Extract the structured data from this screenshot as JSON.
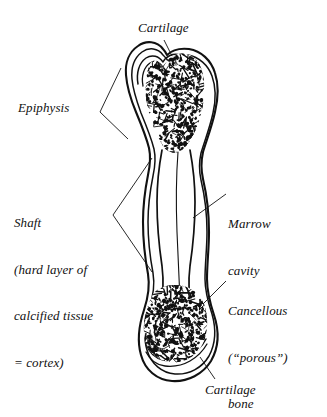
{
  "figure": {
    "background_color": "#ffffff",
    "ink_color": "#111111"
  },
  "labels": {
    "cartilage_top": "Cartilage",
    "epiphysis": "Epiphysis",
    "shaft_line1": "Shaft",
    "shaft_line2": "(hard layer of",
    "shaft_line3": "calcified tissue",
    "shaft_line4": "= cortex)",
    "marrow_line1": "Marrow",
    "marrow_line2": "cavity",
    "cancellous_line1": "Cancellous",
    "cancellous_line2": "(“porous”)",
    "cancellous_line3": "bone",
    "cartilage_bottom": "Cartilage"
  },
  "icons": {
    "leader_line": "leader-line-icon",
    "bracket": "angle-bracket-icon",
    "bone": "long-bone-icon",
    "trabeculae": "cancellous-speckle-icon"
  }
}
